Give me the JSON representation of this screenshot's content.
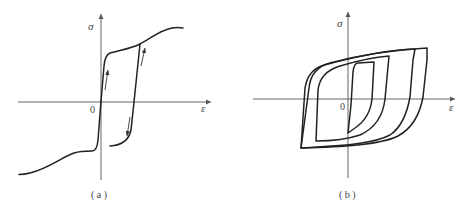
{
  "panels": [
    {
      "id": "a",
      "caption": "( a )",
      "y_axis_label": "σ",
      "x_axis_label": "ε",
      "origin_label": "0",
      "description": "Stress-strain curve with strain-hardening plateau; loading from origin up steeply, plateau, then S-shaped rise; unloading drops vertically near ε offset; arrows indicate loading path direction"
    },
    {
      "id": "b",
      "caption": "( b )",
      "y_axis_label": "σ",
      "x_axis_label": "ε",
      "origin_label": "0",
      "description": "Three nested hysteresis loops of increasing strain amplitude"
    }
  ],
  "colors": {
    "curve": "#222222",
    "axis": "#555555",
    "text": "#444444",
    "background": "#ffffff"
  }
}
